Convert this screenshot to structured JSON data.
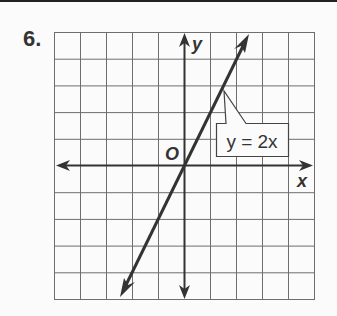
{
  "problem": {
    "number": "6."
  },
  "graph": {
    "grid": {
      "cols": 10,
      "rows": 10,
      "x_min": -5,
      "x_max": 5,
      "y_min": -5,
      "y_max": 5
    },
    "axes": {
      "x_label": "x",
      "y_label": "y",
      "origin_label": "O"
    },
    "line": {
      "equation_label": "y = 2x",
      "slope": 2,
      "intercept": 0
    },
    "colors": {
      "grid": "#6e6e6e",
      "axis": "#333333",
      "line": "#333333"
    }
  }
}
